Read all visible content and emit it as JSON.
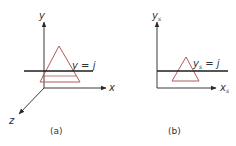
{
  "colors": {
    "axis": "#3a3a3a",
    "scanline": "#1e1e1e",
    "triangle": "#b35a5a",
    "text": "#333333"
  },
  "panel_a": {
    "caption": "(a)",
    "y_axis_label": "y",
    "x_axis_label": "x",
    "z_axis_label": "z",
    "scanline_label": "y = j"
  },
  "panel_b": {
    "caption": "(b)",
    "y_axis_label": "y",
    "y_axis_subscript": "s",
    "x_axis_label": "x",
    "x_axis_subscript": "s",
    "scanline_label": "y",
    "scanline_subscript": "s",
    "scanline_rhs": " = j"
  }
}
